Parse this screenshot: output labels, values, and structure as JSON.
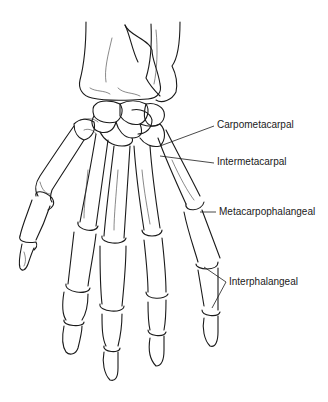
{
  "figure": {
    "labels": [
      {
        "id": "carpometacarpal",
        "text": "Carpometacarpal",
        "x": 217,
        "y": 124
      },
      {
        "id": "intermetacarpal",
        "text": "Intermetacarpal",
        "x": 217,
        "y": 161
      },
      {
        "id": "metacarpophalangeal",
        "text": "Metacarpophalangeal",
        "x": 219,
        "y": 210
      },
      {
        "id": "interphalangeal",
        "text": "Interphalangeal",
        "x": 229,
        "y": 280
      }
    ],
    "colors": {
      "line": "#1a1a1a",
      "background": "#ffffff"
    }
  }
}
